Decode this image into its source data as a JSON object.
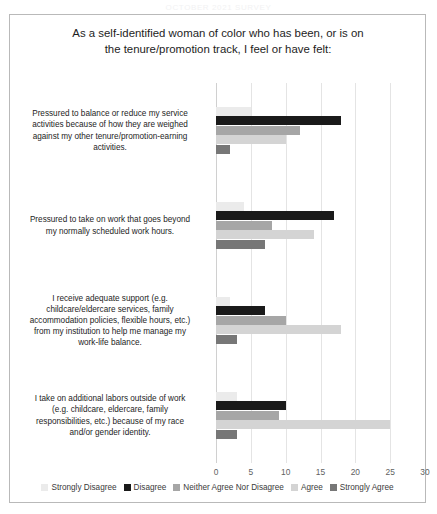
{
  "page_header": "OCTOBER 2021 SURVEY",
  "chart_data": {
    "type": "bar",
    "orientation": "horizontal",
    "title_lines": [
      "As a self-identified woman of color who has been, or is on",
      "the tenure/promotion  track, I feel or have felt:"
    ],
    "xlabel": "",
    "ylabel": "",
    "xlim": [
      0,
      30
    ],
    "xticks": [
      "0",
      "5",
      "10",
      "15",
      "20",
      "25",
      "30"
    ],
    "grid": true,
    "legend_position": "bottom",
    "categories": [
      "Pressured to balance or reduce my service activities because of how they are weighed against my other tenure/promotion-earning activities.",
      "Pressured to take on work that goes beyond my normally scheduled work hours.",
      "I receive adequate support (e.g. childcare/eldercare services, family accommodation policies, flexible hours, etc.) from my institution to help me manage my work-life balance.",
      "I take on additional labors outside of work (e.g. childcare, eldercare, family responsibilities, etc.) because of my race and/or gender identity."
    ],
    "category_lines": [
      [
        "Pressured to balance or reduce my service",
        "activities because of how they are weighed",
        "against my other tenure/promotion-earning",
        "activities."
      ],
      [
        "Pressured to take on work that goes beyond",
        "my normally scheduled work hours."
      ],
      [
        "I receive adequate support (e.g.",
        "childcare/eldercare services, family",
        "accommodation policies, flexible hours, etc.)",
        "from my institution to help me manage my",
        "work-life balance."
      ],
      [
        "I take on additional labors outside of work",
        "(e.g. childcare, eldercare, family",
        "responsibilities, etc.) because of my race",
        "and/or gender identity."
      ]
    ],
    "series": [
      {
        "name": "Strongly Disagree",
        "color": "#ebebeb",
        "values": [
          5,
          4,
          2,
          3
        ]
      },
      {
        "name": "Disagree",
        "color": "#1a1a1a",
        "values": [
          18,
          17,
          7,
          10
        ]
      },
      {
        "name": "Neither Agree Nor Disagree",
        "color": "#a6a6a6",
        "values": [
          12,
          8,
          10,
          9
        ]
      },
      {
        "name": "Agree",
        "color": "#d4d4d4",
        "values": [
          10,
          14,
          18,
          25
        ]
      },
      {
        "name": "Strongly Agree",
        "color": "#777777",
        "values": [
          2,
          7,
          3,
          3
        ]
      }
    ]
  }
}
